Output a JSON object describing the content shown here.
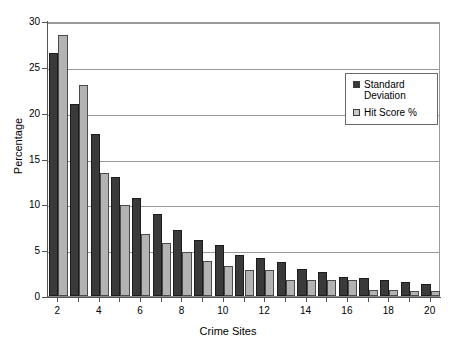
{
  "chart_data": {
    "type": "bar",
    "title": "",
    "xlabel": "Crime Sites",
    "ylabel": "Percentage",
    "categories": [
      2,
      3,
      4,
      5,
      6,
      7,
      8,
      9,
      10,
      11,
      12,
      13,
      14,
      15,
      16,
      17,
      18,
      19,
      20
    ],
    "xtick_labels": [
      "2",
      "4",
      "6",
      "8",
      "10",
      "12",
      "14",
      "16",
      "18",
      "20"
    ],
    "xtick_values": [
      2,
      4,
      6,
      8,
      10,
      12,
      14,
      16,
      18,
      20
    ],
    "ytick_labels": [
      "0",
      "5",
      "10",
      "15",
      "20",
      "25",
      "30"
    ],
    "ytick_values": [
      0,
      5,
      10,
      15,
      20,
      25,
      30
    ],
    "ylim": [
      0,
      30
    ],
    "grid": "horizontal",
    "legend_position": "upper-right",
    "series": [
      {
        "name": "Standard\nDeviation",
        "color": "#3a3a3a",
        "values": [
          26.5,
          21.0,
          17.7,
          13.0,
          10.7,
          8.9,
          7.2,
          6.1,
          5.6,
          4.5,
          4.1,
          3.7,
          2.9,
          2.6,
          2.1,
          2.0,
          1.8,
          1.5,
          1.35
        ]
      },
      {
        "name": "Hit Score %",
        "color": "#b3b3b3",
        "values": [
          28.5,
          23.0,
          13.4,
          9.9,
          6.8,
          5.8,
          4.8,
          3.8,
          3.3,
          2.8,
          2.8,
          1.7,
          1.7,
          1.7,
          1.7,
          0.7,
          0.7,
          0.6,
          0.6
        ]
      }
    ]
  }
}
